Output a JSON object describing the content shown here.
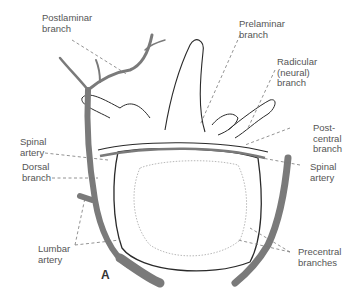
{
  "figure": {
    "panel_letter": "A",
    "colors": {
      "artery_fill": "#7a7a7a",
      "outline": "#2a2a2a",
      "leader_line": "#777777",
      "label_text": "#555555"
    },
    "labels": {
      "postlaminar": "Postlaminar\nbranch",
      "prelaminar": "Prelaminar\nbranch",
      "radicular": "Radicular\n(neural)\nbranch",
      "spinal_left": "Spinal\nartery",
      "postcentral": "Post-\ncentral\nbranch",
      "dorsal": "Dorsal\nbranch",
      "spinal_right": "Spinal\nartery",
      "lumbar": "Lumbar\nartery",
      "precentral": "Precentral\nbranches"
    }
  }
}
